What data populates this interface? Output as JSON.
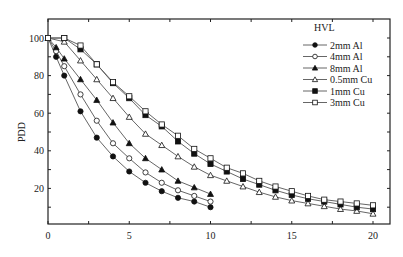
{
  "chart_data": {
    "type": "line",
    "title": "",
    "xlabel": "",
    "ylabel": "PDD",
    "xlim": [
      0,
      21
    ],
    "ylim": [
      0,
      105
    ],
    "xticks": [
      0,
      5,
      10,
      15,
      20
    ],
    "yticks": [
      20,
      40,
      60,
      80,
      100
    ],
    "grid": false,
    "legend": {
      "title": "HVL",
      "position": "upper right"
    },
    "series": [
      {
        "name": "2mm Al",
        "marker": "filled-circle",
        "x": [
          0,
          0.5,
          1,
          2,
          3,
          4,
          5,
          6,
          7,
          8,
          9,
          10
        ],
        "y": [
          100,
          90,
          80,
          61,
          47,
          37,
          29,
          23,
          18.5,
          15,
          13,
          10
        ]
      },
      {
        "name": "4mm Al",
        "marker": "open-circle",
        "x": [
          0,
          0.5,
          1,
          2,
          3,
          4,
          5,
          6,
          7,
          8,
          9,
          10
        ],
        "y": [
          100,
          93,
          85,
          70,
          56,
          44,
          36,
          28.5,
          23,
          19,
          16,
          13
        ]
      },
      {
        "name": "8mm Al",
        "marker": "filled-triangle",
        "x": [
          0,
          0.5,
          1,
          2,
          3,
          4,
          5,
          6,
          7,
          8,
          9,
          10
        ],
        "y": [
          100,
          95,
          89,
          78,
          67,
          55,
          44,
          36,
          30,
          24,
          20.5,
          17
        ]
      },
      {
        "name": "0.5mm Cu",
        "marker": "open-triangle",
        "x": [
          0,
          1,
          2,
          3,
          4,
          5,
          6,
          7,
          8,
          9,
          10,
          11,
          12,
          13,
          14,
          15,
          16,
          17,
          18,
          19,
          20
        ],
        "y": [
          100,
          98,
          88,
          78,
          68,
          58,
          49,
          43,
          37,
          31.5,
          27,
          24,
          21,
          18,
          15.5,
          13.5,
          12,
          10.5,
          9,
          8,
          6.5
        ]
      },
      {
        "name": "1mm Cu",
        "marker": "filled-square",
        "x": [
          0,
          1,
          2,
          3,
          4,
          5,
          6,
          7,
          8,
          9,
          10,
          11,
          12,
          13,
          14,
          15,
          16,
          17,
          18,
          19,
          20
        ],
        "y": [
          100,
          100,
          94,
          86,
          76,
          68,
          59,
          53,
          45,
          38.5,
          33,
          29,
          25,
          22,
          19,
          16.5,
          14.5,
          13,
          11.5,
          10,
          9
        ]
      },
      {
        "name": "3mm Cu",
        "marker": "open-square",
        "x": [
          0,
          1,
          2,
          3,
          4,
          5,
          6,
          7,
          8,
          9,
          10,
          11,
          12,
          13,
          14,
          15,
          16,
          17,
          18,
          19,
          20
        ],
        "y": [
          100,
          100,
          96,
          86,
          76.5,
          69,
          61,
          54,
          48,
          41,
          36,
          31,
          28,
          24,
          21,
          18.5,
          16,
          14,
          13,
          12,
          11
        ]
      }
    ]
  },
  "colors": {
    "line": "#555555",
    "marker": "#111111",
    "axis": "#222222",
    "background": "#ffffff"
  }
}
